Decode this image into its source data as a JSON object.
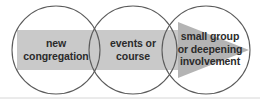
{
  "diagram": {
    "type": "venn-flow",
    "title": "",
    "background_color": "#ffffff",
    "band": {
      "color": "#c9c9c9",
      "x": 17,
      "y": 30,
      "width": 179,
      "height": 40
    },
    "arrow": {
      "name": "right-arrow",
      "color": "#b4b4b4",
      "points": "178,22 178,78 249,50",
      "direction": "right"
    },
    "circles": [
      {
        "id": "circle-1",
        "cx": 56,
        "cy": 50,
        "r": 44,
        "stroke": "#5b5b5b",
        "fill": "none"
      },
      {
        "id": "circle-2",
        "cx": 133,
        "cy": 50,
        "r": 44,
        "stroke": "#5b5b5b",
        "fill": "none"
      },
      {
        "id": "circle-3",
        "cx": 206,
        "cy": 50,
        "r": 44,
        "stroke": "#5b5b5b",
        "fill": "none"
      }
    ],
    "baseline_rule": {
      "color": "#d6d6d6",
      "y": 98
    },
    "stages": [
      {
        "id": "stage-1",
        "label": "new\ncongregation"
      },
      {
        "id": "stage-2",
        "label": "events or\ncourse"
      },
      {
        "id": "stage-3",
        "label": "small group\nor deepening\ninvolvement"
      }
    ]
  }
}
